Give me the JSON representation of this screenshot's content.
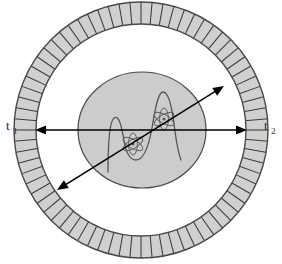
{
  "figure": {
    "background_color": "#ffffff",
    "width": 282,
    "height": 264
  },
  "labels": {
    "left": {
      "base": "t",
      "subscript": "1",
      "full": "t1",
      "x": 6,
      "y": 130
    },
    "right": {
      "base": "t",
      "subscript": "2",
      "full": "t2",
      "x": 264,
      "y": 130
    }
  },
  "detector_ring": {
    "name": "detector-ring",
    "center_x": 141,
    "center_y": 130,
    "outer_rx": 127,
    "outer_ry": 128,
    "inner_rx": 105,
    "inner_ry": 106,
    "fill_color": "#d0d0d0",
    "stroke_color": "#4a4a4a",
    "segment_count": 72,
    "segment_line_color": "#3c3c3c",
    "description": "Annular detector array of radial crystal elements"
  },
  "inner_object": {
    "name": "patient-cross-section",
    "center_x": 142,
    "center_y": 130,
    "rx": 64,
    "ry": 58,
    "fill_color": "#cccccc",
    "stroke_color": "#4a4a4a",
    "description": "Shaded elliptical object inside the bore"
  },
  "atoms": [
    {
      "name": "atom-lower-left",
      "cx": 133,
      "cy": 144,
      "radius": 11,
      "orbitals": 3,
      "nucleus_radius": 1.6,
      "stroke_color": "#5c5c5c"
    },
    {
      "name": "atom-upper-right",
      "cx": 164,
      "cy": 119,
      "radius": 11,
      "orbitals": 3,
      "nucleus_radius": 1.6,
      "stroke_color": "#5c5c5c"
    }
  ],
  "wave_curve": {
    "name": "wavefunction-curve",
    "stroke_color": "#555555",
    "stroke_width": 1.3,
    "description": "Wavefunction profile with a small left lobe and a tall right lobe",
    "path": "M 108 172 C 108 150 109 122 114 118 C 119 114 122 128 124 141 C 126 152 130 160 136 160 C 143 160 148 150 152 128 C 155 110 158 92 163 92 C 169 92 172 108 174 124 C 176 140 178 152 181 160"
  },
  "arrows": {
    "horizontal": {
      "name": "horizontal-photon-path",
      "x1": 35,
      "y1": 130,
      "x2": 247,
      "y2": 130,
      "stroke_color": "#000000",
      "stroke_width": 1.6,
      "double_headed": true,
      "description": "Horizontal line of response between opposite detector elements t1 and t2"
    },
    "diagonal": {
      "name": "diagonal-photon-path",
      "x1": 57,
      "y1": 190,
      "x2": 224,
      "y2": 86,
      "stroke_color": "#000000",
      "stroke_width": 1.6,
      "double_headed": true,
      "description": "Oblique line of response across the field of view"
    }
  },
  "colors": {
    "ring_fill": "#d0d0d0",
    "ring_stroke": "#4a4a4a",
    "object_fill": "#cccccc",
    "arrow": "#000000",
    "text": "#2b2b2b"
  }
}
